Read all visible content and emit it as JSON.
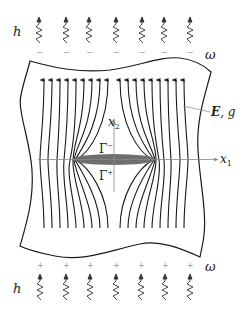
{
  "diagram": {
    "labels": {
      "heat_top": "h",
      "heat_bottom": "h",
      "domain_top": "ω",
      "domain_bottom": "ω",
      "field": "E, g",
      "field_E": "E",
      "field_g": ", g",
      "axis_x1": "x",
      "axis_x1_sub": "1",
      "axis_x2": "x",
      "axis_x2_sub": "2",
      "gamma_minus": "Γ",
      "gamma_minus_sup": "−",
      "gamma_plus": "Γ",
      "gamma_plus_sup": "+"
    },
    "charges": {
      "top_sign": "−",
      "bottom_sign": "+",
      "count": 7
    },
    "heat_source_count": 7,
    "field_line_count": 18,
    "colors": {
      "line": "#1a1a1a",
      "crack_fill": "#6e6e6e",
      "axis": "#888888",
      "charge": "#999999"
    }
  }
}
